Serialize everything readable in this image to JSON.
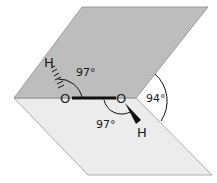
{
  "diagram": {
    "colors": {
      "top_plane": "#bdbdbd",
      "bottom_plane": "#ececec",
      "plane_edge": "#8a8a8a",
      "bond": "#111111"
    },
    "atoms": {
      "o_left": "O",
      "o_right": "O",
      "h_top": "H",
      "h_bottom": "H"
    },
    "angles": {
      "h_o_o_upper": "97°",
      "o_o_h_lower": "97°",
      "dihedral": "94°"
    }
  }
}
